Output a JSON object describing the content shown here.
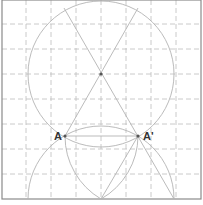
{
  "diagram": {
    "frame": {
      "x": 2,
      "y": 0,
      "w": 199,
      "h": 199
    },
    "grid": {
      "vertical_x": [
        26,
        51,
        76,
        101,
        126,
        151,
        176
      ],
      "horizontal_y": [
        24,
        49,
        74,
        99,
        124,
        149,
        174
      ]
    },
    "circles": [
      {
        "name": "upper-circle",
        "cx": 101,
        "cy": 74,
        "r": 73
      },
      {
        "name": "lower-circle",
        "cx": 101,
        "cy": 199,
        "r": 73
      }
    ],
    "arcs": [
      {
        "name": "arc-centered-A-prime",
        "d": "M 65 136 A 73 73 0 0 0 101 199"
      },
      {
        "name": "arc-centered-A",
        "d": "M 138 136 A 73 73 0 0 1 101 199"
      }
    ],
    "lines": [
      {
        "name": "diagonal-from-top-left",
        "x1": 64,
        "y1": 8,
        "x2": 174,
        "y2": 199
      },
      {
        "name": "diagonal-from-top-right",
        "x1": 138,
        "y1": 8,
        "x2": 65,
        "y2": 136
      },
      {
        "name": "chord-A-A-prime",
        "x1": 65,
        "y1": 136,
        "x2": 138,
        "y2": 136
      },
      {
        "name": "line-A-prime-to-bottom",
        "x1": 138,
        "y1": 136,
        "x2": 101,
        "y2": 199
      }
    ],
    "points": [
      {
        "name": "center-point",
        "x": 101,
        "y": 74,
        "label": ""
      },
      {
        "name": "point-A",
        "x": 65,
        "y": 136,
        "label": "A"
      },
      {
        "name": "point-A-prime",
        "x": 138,
        "y": 136,
        "label": "A'"
      }
    ],
    "labels": {
      "A": {
        "text": "A",
        "x": 54,
        "y": 140
      },
      "A_prime": {
        "text": "A'",
        "x": 143,
        "y": 140
      }
    }
  }
}
